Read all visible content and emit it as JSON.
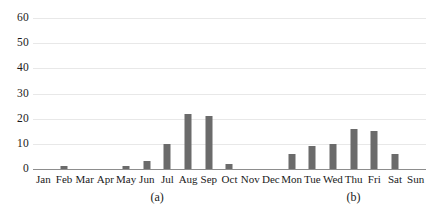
{
  "figure": {
    "background_color": "#ffffff",
    "bar_color": "#6b6b6b",
    "gridline_color": "#e8e8e8",
    "axis_color": "#8d8d8d"
  },
  "captions": {
    "panel_a": "(a)",
    "panel_b": "(b)"
  },
  "yaxis": {
    "ticks": [
      "0",
      "10",
      "20",
      "30",
      "40",
      "50",
      "60"
    ]
  },
  "chart_data": [
    {
      "type": "bar",
      "title": "(a)",
      "xlabel": "",
      "ylabel": "",
      "ylim": [
        0,
        60
      ],
      "yticks": [
        0,
        10,
        20,
        30,
        40,
        50,
        60
      ],
      "grid": true,
      "legend": "none",
      "categories": [
        "Jan",
        "Feb",
        "Mar",
        "Apr",
        "May",
        "Jun",
        "Jul",
        "Aug",
        "Sep",
        "Oct",
        "Nov",
        "Dec"
      ],
      "values": [
        0,
        1,
        0,
        0,
        1,
        3,
        10,
        22,
        21,
        2,
        0,
        0
      ]
    },
    {
      "type": "bar",
      "title": "(b)",
      "xlabel": "",
      "ylabel": "",
      "ylim": [
        0,
        60
      ],
      "yticks": [
        0,
        10,
        20,
        30,
        40,
        50,
        60
      ],
      "grid": true,
      "legend": "none",
      "categories": [
        "Mon",
        "Tue",
        "Wed",
        "Thu",
        "Fri",
        "Sat",
        "Sun"
      ],
      "values": [
        6,
        9,
        10,
        16,
        15,
        6,
        0
      ]
    }
  ]
}
